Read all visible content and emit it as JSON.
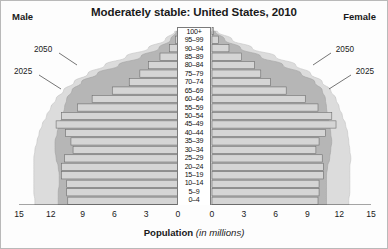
{
  "chart": {
    "title": "Moderately stable: United States, 2010",
    "male_label": "Male",
    "female_label": "Female",
    "axis_title_bold": "Population",
    "axis_title_italic": "(in millions)"
  },
  "annotations": {
    "outer_left": "2050",
    "inner_left": "2025",
    "outer_right": "2050",
    "inner_right": "2025"
  },
  "chart_data": {
    "type": "bar",
    "subtype": "population-pyramid",
    "title": "Moderately stable: United States, 2010",
    "xlabel": "Population (in millions)",
    "ylabel": "Age group",
    "xlim": [
      0,
      15
    ],
    "x_tick_labels_left": [
      "15",
      "12",
      "9",
      "6",
      "3",
      "0"
    ],
    "x_tick_labels_right": [
      "0",
      "3",
      "6",
      "9",
      "12",
      "15"
    ],
    "x_ticks": [
      0,
      3,
      6,
      9,
      12,
      15
    ],
    "grid": false,
    "legend_position": "inline-annotations",
    "categories": [
      "0–4",
      "5–9",
      "10–14",
      "15–19",
      "20–24",
      "25–29",
      "30–34",
      "35–39",
      "40–44",
      "45–49",
      "50–54",
      "55–59",
      "60–64",
      "65–69",
      "70–74",
      "75–79",
      "80–84",
      "85–89",
      "90–94",
      "95–99",
      "100+"
    ],
    "series": [
      {
        "name": "Male 2010",
        "side": "left",
        "values": [
          10.4,
          10.5,
          10.5,
          11.0,
          11.0,
          10.7,
          9.9,
          10.1,
          10.6,
          11.5,
          11.0,
          9.5,
          8.1,
          6.2,
          4.6,
          3.6,
          2.8,
          1.7,
          0.8,
          0.25,
          0.05
        ]
      },
      {
        "name": "Female 2010",
        "side": "right",
        "values": [
          10.0,
          10.1,
          10.1,
          10.5,
          10.5,
          10.4,
          9.8,
          10.1,
          10.7,
          11.7,
          11.3,
          10.0,
          8.8,
          7.0,
          5.5,
          4.6,
          4.0,
          2.8,
          1.6,
          0.6,
          0.12
        ]
      },
      {
        "name": "Male 2025 projection",
        "side": "left",
        "envelope": true,
        "values": [
          11.3,
          11.3,
          11.2,
          11.2,
          11.3,
          11.5,
          11.6,
          11.6,
          11.4,
          11.2,
          10.9,
          10.7,
          10.5,
          10.0,
          9.1,
          7.6,
          5.6,
          3.5,
          1.8,
          0.7,
          0.15
        ]
      },
      {
        "name": "Female 2025 projection",
        "side": "right",
        "envelope": true,
        "values": [
          10.8,
          10.8,
          10.8,
          10.8,
          10.9,
          11.1,
          11.2,
          11.3,
          11.2,
          11.1,
          10.9,
          10.8,
          10.7,
          10.4,
          9.7,
          8.4,
          6.7,
          4.6,
          2.7,
          1.2,
          0.3
        ]
      },
      {
        "name": "Male 2050 projection",
        "side": "left",
        "envelope": true,
        "values": [
          13.5,
          13.6,
          13.6,
          13.6,
          13.6,
          13.6,
          13.5,
          13.3,
          13.1,
          12.8,
          12.4,
          12.0,
          11.5,
          10.8,
          9.8,
          8.5,
          6.9,
          4.9,
          2.8,
          1.2,
          0.3
        ]
      },
      {
        "name": "Female 2050 projection",
        "side": "right",
        "envelope": true,
        "values": [
          12.9,
          13.0,
          13.0,
          13.0,
          13.0,
          13.1,
          13.0,
          12.9,
          12.8,
          12.6,
          12.3,
          12.0,
          11.7,
          11.2,
          10.4,
          9.3,
          7.9,
          6.0,
          3.8,
          1.9,
          0.5
        ]
      }
    ],
    "colors": {
      "bar_fill": "#d5d5d5",
      "bar_stroke": "#6e6e6e",
      "envelope_2025": "#b6b6b6",
      "envelope_2050": "#dcdcdc",
      "axis": "#4a4a4a",
      "text": "#1a1a1a",
      "background": "#ffffff"
    }
  }
}
